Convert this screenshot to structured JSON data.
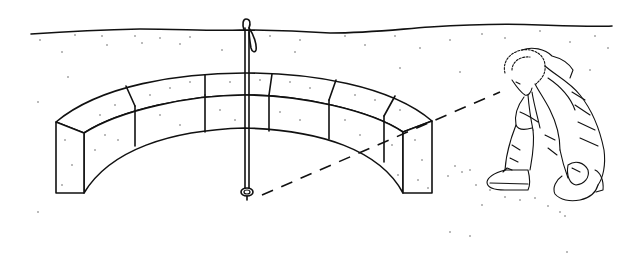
{
  "illustration": {
    "description": "Line drawing of a person in a hooded winter parka kneeling on snow, sighting along a dashed line toward the base of a survey pole planted in front of a curved wall of snow blocks",
    "elements": [
      {
        "name": "horizon-line",
        "type": "snow horizon"
      },
      {
        "name": "snow-block-wall",
        "type": "curved arc of snow blocks",
        "top_course_blocks": 6,
        "front_course_blocks": 6
      },
      {
        "name": "survey-pole",
        "type": "probe pole with strap loop handle"
      },
      {
        "name": "sight-line",
        "type": "dashed line of sight"
      },
      {
        "name": "kneeling-person",
        "type": "figure in fur-trimmed hood parka and boots"
      }
    ],
    "colors": {
      "line": "#111111",
      "background": "#ffffff",
      "stipple": "#444444"
    }
  }
}
